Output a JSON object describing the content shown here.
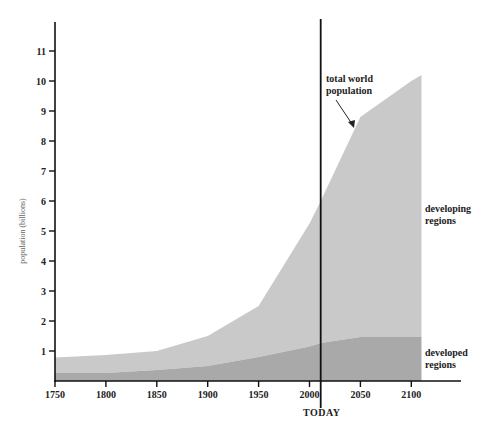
{
  "chart_data": {
    "type": "area",
    "title": "",
    "xlabel": "",
    "ylabel": "population (billions)",
    "x": [
      1750,
      1800,
      1850,
      1900,
      1950,
      2000,
      2011,
      2050,
      2100,
      2110
    ],
    "series": [
      {
        "name": "developed regions",
        "label_lines": [
          "developed",
          "regions"
        ],
        "color": "#a9a9a9",
        "values": [
          0.27,
          0.27,
          0.37,
          0.5,
          0.8,
          1.15,
          1.27,
          1.47,
          1.47,
          1.47
        ]
      },
      {
        "name": "developing regions",
        "label_lines": [
          "developing",
          "regions"
        ],
        "color": "#c9c9c9",
        "values": [
          0.51,
          0.6,
          0.63,
          1.0,
          1.7,
          4.1,
          4.73,
          7.33,
          8.53,
          8.73
        ]
      }
    ],
    "total": {
      "name": "total world population",
      "label_lines": [
        "total world",
        "population"
      ],
      "values": [
        0.78,
        0.87,
        1.0,
        1.5,
        2.5,
        5.25,
        6.0,
        8.8,
        10.0,
        10.2
      ]
    },
    "x_ticks": [
      1750,
      1800,
      1850,
      1900,
      1950,
      2000,
      2050,
      2100
    ],
    "y_ticks": [
      1,
      2,
      3,
      4,
      5,
      6,
      7,
      8,
      9,
      10,
      11
    ],
    "xlim": [
      1750,
      2150
    ],
    "ylim": [
      0,
      11.9
    ],
    "grid": false,
    "legend": "inline labels at right",
    "annotations": [
      {
        "text": "TODAY",
        "x": 2011,
        "type": "vertical-line"
      },
      {
        "text": "total world population",
        "type": "arrow",
        "points_to_year": 2047
      }
    ]
  }
}
